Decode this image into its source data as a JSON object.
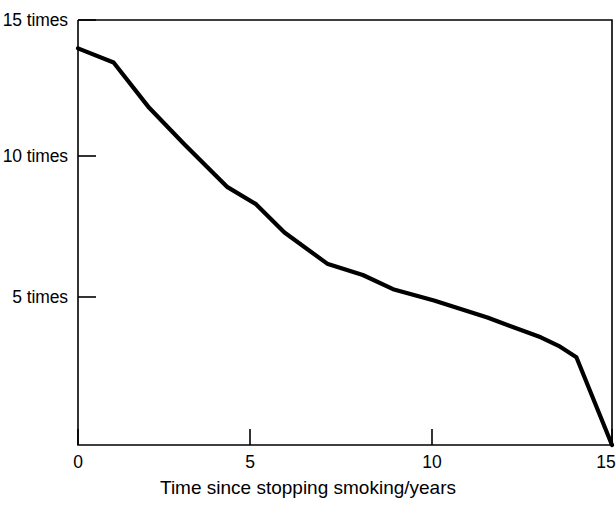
{
  "chart_data": {
    "type": "line",
    "title": "",
    "subtitle": "",
    "xlabel": "Time since stopping smoking/years",
    "ylabel": "",
    "xlim": [
      0,
      15
    ],
    "ylim": [
      0,
      15
    ],
    "grid": false,
    "legend": null,
    "x_ticks": [
      {
        "value": 0,
        "label": "0"
      },
      {
        "value": 5,
        "label": "5"
      },
      {
        "value": 10,
        "label": "10"
      },
      {
        "value": 15,
        "label": "15"
      }
    ],
    "y_ticks": [
      {
        "value": 15,
        "label": "15 times"
      },
      {
        "value": 10,
        "label": "10 times"
      },
      {
        "value": 5,
        "label": "5 times"
      }
    ],
    "series": [
      {
        "name": "Relative risk of lung cancer",
        "color": "#000000",
        "x": [
          0,
          1,
          2,
          3,
          4.2,
          5,
          5.8,
          7,
          8,
          8.85,
          10,
          11.5,
          13,
          13.5,
          14,
          15
        ],
        "values": [
          14.0,
          13.5,
          11.9,
          10.6,
          9.1,
          8.5,
          7.5,
          6.4,
          6.0,
          5.5,
          5.1,
          4.5,
          3.8,
          3.5,
          3.1,
          0.0
        ]
      }
    ]
  }
}
